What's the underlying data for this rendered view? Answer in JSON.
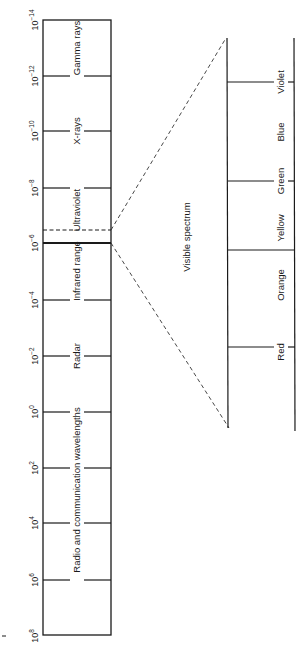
{
  "diagram": {
    "stroke_color": "#1a1a1a",
    "main_scale": {
      "tick_labels": [
        {
          "base": "10",
          "exp": "−14"
        },
        {
          "base": "10",
          "exp": "−12"
        },
        {
          "base": "10",
          "exp": "−10"
        },
        {
          "base": "10",
          "exp": "−8"
        },
        {
          "base": "10",
          "exp": "−6"
        },
        {
          "base": "10",
          "exp": "−4"
        },
        {
          "base": "10",
          "exp": "−2"
        },
        {
          "base": "10",
          "exp": "0"
        },
        {
          "base": "10",
          "exp": "2"
        },
        {
          "base": "10",
          "exp": "4"
        },
        {
          "base": "10",
          "exp": "6"
        },
        {
          "base": "10",
          "exp": "8"
        }
      ],
      "bands": [
        {
          "label": "Gamma rays"
        },
        {
          "label": "X-rays"
        },
        {
          "label": "Ultraviolet"
        },
        {
          "label": "Infrared range"
        },
        {
          "label": "Radar"
        },
        {
          "label": "Radio and communication wavelengths"
        }
      ]
    },
    "visible": {
      "title": "Visible spectrum",
      "colors": [
        {
          "label": "Violet"
        },
        {
          "label": "Blue"
        },
        {
          "label": "Green"
        },
        {
          "label": "Yellow"
        },
        {
          "label": "Orange"
        },
        {
          "label": "Red"
        }
      ]
    }
  }
}
